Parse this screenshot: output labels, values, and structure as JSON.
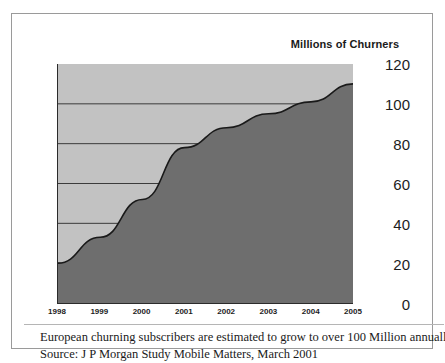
{
  "figure": {
    "title": "Millions of Churners",
    "caption_line_1": "European churning subscribers are estimated to grow to over 100 Million annually",
    "caption_line_2": "Source: J P Morgan Study Mobile Matters, March 2001"
  },
  "colors": {
    "plot_background": "#c2c2c2",
    "area_fill": "#6e6e6e",
    "line": "#1a1a1a",
    "gridline": "#2b2b2b",
    "frame": "#9a9a9a",
    "text": "#1a1a1a"
  },
  "chart_data": {
    "type": "area",
    "title": "Millions of Churners",
    "xlabel": "",
    "ylabel": "Millions of Churners",
    "categories": [
      "1998",
      "1999",
      "2000",
      "2001",
      "2002",
      "2003",
      "2004",
      "2005"
    ],
    "x": [
      1998,
      1999,
      2000,
      2001,
      2002,
      2003,
      2004,
      2005
    ],
    "values": [
      20,
      33,
      52,
      78,
      88,
      95,
      101,
      110
    ],
    "series": [
      {
        "name": "European churning subscribers",
        "values": [
          20,
          33,
          52,
          78,
          88,
          95,
          101,
          110
        ]
      }
    ],
    "ylim": [
      0,
      120
    ],
    "yticks": [
      0,
      20,
      40,
      60,
      80,
      100,
      120
    ],
    "ytick_labels": [
      "0",
      "20",
      "40",
      "60",
      "80",
      "100",
      "120"
    ],
    "xticks": [
      1998,
      1999,
      2000,
      2001,
      2002,
      2003,
      2004,
      2005
    ],
    "xtick_labels": [
      "1998",
      "1999",
      "2000",
      "2001",
      "2002",
      "2003",
      "2004",
      "2005"
    ],
    "grid": true,
    "grid_axis": "y",
    "legend": false,
    "legend_position": "none"
  }
}
